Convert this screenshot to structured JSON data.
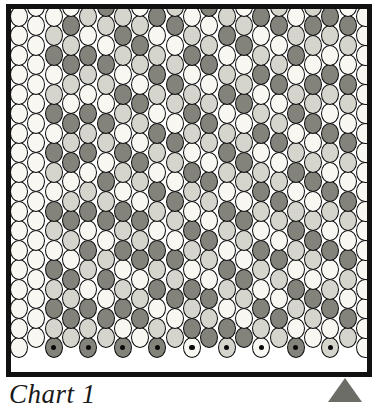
{
  "figure": {
    "caption": "Chart 1",
    "kind": "beading-pattern-chart"
  },
  "colors": {
    "bead_white": "#f8f7f2",
    "bead_light": "#d6d5cd",
    "bead_dark": "#83837b",
    "bead_outline": "#0c0c0c",
    "frame": "#111111",
    "marker": "#6d6d68",
    "background": "#ffffff",
    "dot": "#0a0a0a"
  },
  "marker": {
    "shape": "triangle-up",
    "label": "start-column-marker",
    "column_index": 18
  },
  "chart_data": {
    "type": "heatmap",
    "title": "Chart 1",
    "xlabel": "",
    "ylabel": "",
    "grid": "offset-brick",
    "columns": 21,
    "rows": 18,
    "bead_width": 18,
    "bead_height": 21,
    "column_offset_pattern": "alternating half-drop",
    "palette_keys": [
      "w",
      "l",
      "d"
    ],
    "palette_labels": {
      "w": "white bead",
      "l": "light gray bead",
      "d": "dark gray bead"
    },
    "dotted_row_note": "Bottom row beads in even-indexed columns carry a black center dot",
    "dotted_columns": [
      2,
      4,
      6,
      8,
      10,
      12,
      14,
      16,
      18
    ],
    "grid_values": [
      [
        "w",
        "w",
        "w",
        "w",
        "w",
        "w",
        "w",
        "w",
        "w",
        "w",
        "w",
        "w",
        "w",
        "w",
        "w",
        "w",
        "w",
        "w"
      ],
      [
        "w",
        "w",
        "w",
        "w",
        "w",
        "w",
        "w",
        "w",
        "w",
        "w",
        "w",
        "w",
        "w",
        "w",
        "w",
        "w",
        "w",
        "w"
      ],
      [
        "w",
        "l",
        "d",
        "w",
        "l",
        "d",
        "w",
        "d",
        "l",
        "w",
        "d",
        "l",
        "w",
        "d",
        "l",
        "d",
        "l",
        "d"
      ],
      [
        "w",
        "d",
        "l",
        "d",
        "l",
        "w",
        "d",
        "l",
        "d",
        "w",
        "l",
        "d",
        "l",
        "w",
        "d",
        "l",
        "d",
        "l"
      ],
      [
        "l",
        "w",
        "d",
        "l",
        "w",
        "d",
        "l",
        "d",
        "w",
        "l",
        "d",
        "w",
        "d",
        "l",
        "w",
        "d",
        "l",
        "d"
      ],
      [
        "d",
        "l",
        "w",
        "d",
        "l",
        "w",
        "d",
        "l",
        "w",
        "d",
        "l",
        "d",
        "w",
        "l",
        "d",
        "w",
        "d",
        "l"
      ],
      [
        "l",
        "d",
        "l",
        "w",
        "d",
        "l",
        "w",
        "d",
        "l",
        "w",
        "d",
        "l",
        "d",
        "w",
        "l",
        "d",
        "w",
        "d"
      ],
      [
        "w",
        "l",
        "d",
        "l",
        "w",
        "d",
        "l",
        "w",
        "d",
        "l",
        "w",
        "d",
        "l",
        "d",
        "w",
        "l",
        "d",
        "w"
      ],
      [
        "d",
        "w",
        "l",
        "d",
        "l",
        "w",
        "d",
        "l",
        "w",
        "d",
        "l",
        "w",
        "d",
        "l",
        "d",
        "w",
        "l",
        "d"
      ],
      [
        "l",
        "d",
        "w",
        "l",
        "d",
        "l",
        "w",
        "d",
        "l",
        "w",
        "d",
        "l",
        "w",
        "d",
        "l",
        "d",
        "w",
        "l"
      ],
      [
        "w",
        "l",
        "d",
        "w",
        "l",
        "d",
        "l",
        "w",
        "d",
        "l",
        "w",
        "d",
        "l",
        "w",
        "d",
        "l",
        "d",
        "w"
      ],
      [
        "d",
        "w",
        "l",
        "d",
        "w",
        "l",
        "d",
        "l",
        "w",
        "d",
        "l",
        "w",
        "d",
        "l",
        "w",
        "d",
        "l",
        "d"
      ],
      [
        "l",
        "d",
        "w",
        "l",
        "d",
        "w",
        "l",
        "d",
        "l",
        "w",
        "d",
        "l",
        "w",
        "d",
        "l",
        "w",
        "d",
        "l"
      ],
      [
        "w",
        "l",
        "d",
        "w",
        "l",
        "d",
        "w",
        "l",
        "d",
        "l",
        "w",
        "d",
        "l",
        "w",
        "d",
        "l",
        "w",
        "d"
      ],
      [
        "d",
        "w",
        "l",
        "d",
        "w",
        "l",
        "d",
        "w",
        "l",
        "d",
        "l",
        "w",
        "d",
        "l",
        "w",
        "d",
        "l",
        "w"
      ],
      [
        "l",
        "d",
        "w",
        "l",
        "d",
        "w",
        "l",
        "d",
        "w",
        "l",
        "d",
        "l",
        "w",
        "d",
        "l",
        "w",
        "d",
        "l"
      ],
      [
        "w",
        "l",
        "d",
        "w",
        "l",
        "d",
        "w",
        "l",
        "d",
        "w",
        "l",
        "d",
        "l",
        "w",
        "d",
        "l",
        "w",
        "d"
      ],
      [
        "l",
        "d",
        "l",
        "w",
        "d",
        "l",
        "d",
        "w",
        "l",
        "d",
        "w",
        "l",
        "d",
        "l",
        "w",
        "d",
        "l",
        "w"
      ],
      [
        "d",
        "l",
        "w",
        "d",
        "l",
        "w",
        "d",
        "l",
        "w",
        "d",
        "l",
        "w",
        "d",
        "w",
        "l",
        "d",
        "w",
        "l"
      ],
      [
        "w",
        "d",
        "l",
        "w",
        "d",
        "l",
        "w",
        "d",
        "l",
        "w",
        "d",
        "l",
        "w",
        "d",
        "l",
        "w",
        "d",
        "l"
      ],
      [
        "w",
        "w",
        "w",
        "w",
        "w",
        "w",
        "w",
        "w",
        "w",
        "w",
        "w",
        "w",
        "w",
        "w",
        "w",
        "w",
        "w",
        "w"
      ]
    ]
  }
}
